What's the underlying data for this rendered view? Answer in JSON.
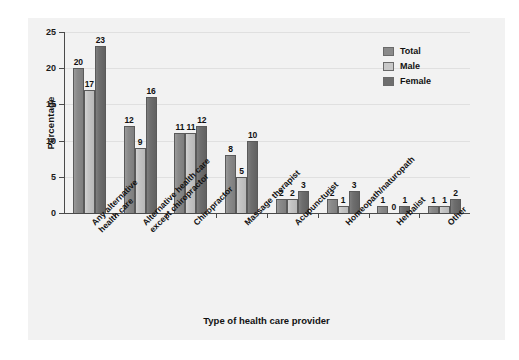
{
  "chart_data": {
    "type": "bar",
    "title": "",
    "xlabel": "Type of health care provider",
    "ylabel": "Percentage",
    "ylim": [
      0,
      25
    ],
    "yticks": [
      0,
      5,
      10,
      15,
      20,
      25
    ],
    "grid": true,
    "legend_position": "top-right",
    "categories": [
      "Any alternative health care",
      "Alternative health care except chiropractor",
      "Chiropractor",
      "Massage therapist",
      "Acupuncturist",
      "Homeopath/naturopath",
      "Herbalist",
      "Other"
    ],
    "category_lines": [
      [
        "Any alternative",
        "health care"
      ],
      [
        "Alternative health care",
        "except chiropractor"
      ],
      [
        "Chiropractor"
      ],
      [
        "Massage therapist"
      ],
      [
        "Acupuncturist"
      ],
      [
        "Homeopath/naturopath"
      ],
      [
        "Herbalist"
      ],
      [
        "Other"
      ]
    ],
    "series": [
      {
        "name": "Total",
        "color": "#8a8a8a",
        "values": [
          20,
          12,
          11,
          8,
          2,
          2,
          1,
          1
        ]
      },
      {
        "name": "Male",
        "color": "#c8c8c8",
        "values": [
          17,
          9,
          11,
          5,
          2,
          1,
          0,
          1
        ]
      },
      {
        "name": "Female",
        "color": "#6e6e6e",
        "values": [
          23,
          16,
          12,
          10,
          3,
          3,
          1,
          2
        ]
      }
    ]
  },
  "legend": {
    "items": [
      {
        "label": "Total"
      },
      {
        "label": "Male"
      },
      {
        "label": "Female"
      }
    ]
  }
}
